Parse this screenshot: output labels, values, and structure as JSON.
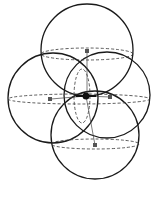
{
  "diagram": {
    "type": "overlapping-spheres",
    "stroke_color": "#1a1a1a",
    "dash_color": "#333333",
    "marker_color": "#555555",
    "spheres": [
      {
        "name": "top",
        "cx": 87,
        "cy": 50,
        "r": 46,
        "equator_ry": 6
      },
      {
        "name": "left",
        "cx": 53,
        "cy": 98,
        "r": 45,
        "equator_ry": 5
      },
      {
        "name": "right",
        "cx": 107,
        "cy": 95,
        "r": 43,
        "equator_ry": 5
      },
      {
        "name": "bottom",
        "cx": 95,
        "cy": 135,
        "r": 44,
        "equator_ry": 5
      }
    ],
    "center_point": {
      "x": 86,
      "y": 96
    }
  }
}
